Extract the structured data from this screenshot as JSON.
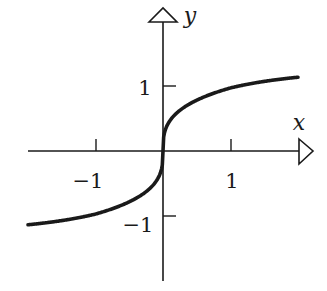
{
  "chart_data": {
    "type": "line",
    "title": "",
    "function": "y = x^(1/3)",
    "xlabel": "x",
    "ylabel": "y",
    "xlim": [
      -2,
      2
    ],
    "ylim": [
      -1.9,
      2.1
    ],
    "x_ticks": [
      -1,
      1
    ],
    "y_ticks": [
      1,
      -1
    ],
    "x_tick_labels": [
      "−1",
      "1"
    ],
    "y_tick_labels": [
      "1",
      "−1"
    ],
    "grid": false,
    "legend": null,
    "series": [
      {
        "name": "cube root",
        "x": [
          -2,
          -1.5,
          -1,
          -0.5,
          -0.2,
          -0.05,
          -0.01,
          0,
          0.01,
          0.05,
          0.2,
          0.5,
          1,
          1.5,
          2
        ],
        "y": [
          -1.17,
          -1.06,
          -0.94,
          -0.76,
          -0.56,
          -0.35,
          -0.2,
          0,
          0.2,
          0.35,
          0.56,
          0.76,
          0.97,
          1.08,
          1.17
        ]
      }
    ]
  },
  "axes": {
    "x_label": "x",
    "y_label": "y",
    "x_tick_neg": "−1",
    "x_tick_pos": "1",
    "y_tick_pos": "1",
    "y_tick_neg": "−1"
  },
  "colors": {
    "ink": "#1a1a1a",
    "background": "#ffffff"
  }
}
